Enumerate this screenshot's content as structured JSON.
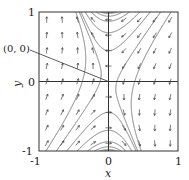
{
  "chart_data": {
    "type": "vector_field",
    "title": "",
    "xlabel": "x",
    "ylabel": "y",
    "xlim": [
      -1,
      1
    ],
    "ylim": [
      -1,
      1
    ],
    "x_ticks": [
      "-1",
      "0",
      "1"
    ],
    "y_ticks": [
      "-1",
      "0",
      "1"
    ],
    "grid": false,
    "field": {
      "description": "saddle point at origin; arrows up on left, down on right, down-left in upper-right, up-right in lower-left",
      "dx": "-0.3*(x+y)",
      "dy": "-x"
    },
    "equilibrium": {
      "x": 0,
      "y": 0,
      "type": "saddle"
    },
    "annotations": [
      {
        "text": "(0, 0)",
        "points_to": [
          0,
          0
        ]
      }
    ],
    "trajectory_seeds": [
      [
        -0.9,
        -1.0
      ],
      [
        -0.75,
        -1.0
      ],
      [
        -0.6,
        -1.0
      ],
      [
        -0.45,
        -1.0
      ],
      [
        -0.3,
        -1.0
      ],
      [
        -0.2,
        -1.0
      ],
      [
        -0.12,
        -1.0
      ],
      [
        0.9,
        1.0
      ],
      [
        0.75,
        1.0
      ],
      [
        0.6,
        1.0
      ],
      [
        0.45,
        1.0
      ],
      [
        0.3,
        1.0
      ],
      [
        0.2,
        1.0
      ],
      [
        0.12,
        1.0
      ],
      [
        -0.05,
        1.0
      ],
      [
        0.05,
        -1.0
      ]
    ],
    "colors": {
      "axis": "#333333",
      "arrow": "#444444",
      "curve": "#777777"
    }
  }
}
